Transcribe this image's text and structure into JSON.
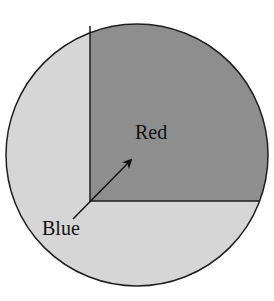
{
  "diagram": {
    "type": "pie-like spinner with rectangular region",
    "regions": [
      {
        "label": "Red",
        "fill": "#8e8e8e",
        "description": "dark rectangular region in upper right"
      },
      {
        "label": "Blue",
        "fill": "#d6d6d6",
        "description": "light remaining area of the circle"
      }
    ],
    "labels": {
      "red": "Red",
      "blue": "Blue"
    },
    "colors": {
      "background": "#ffffff",
      "outline": "#1e1e1e",
      "red_region": "#8e8e8e",
      "blue_region": "#d6d6d6",
      "text": "#111111"
    }
  }
}
